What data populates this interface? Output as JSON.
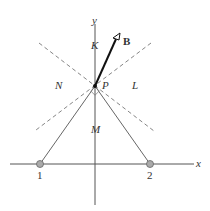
{
  "axes": {
    "x_label": "x",
    "y_label": "y"
  },
  "points": {
    "P": "P",
    "one": "1",
    "two": "2"
  },
  "regions": {
    "K": "K",
    "L": "L",
    "M": "M",
    "N": "N"
  },
  "vector": {
    "label": "B"
  }
}
